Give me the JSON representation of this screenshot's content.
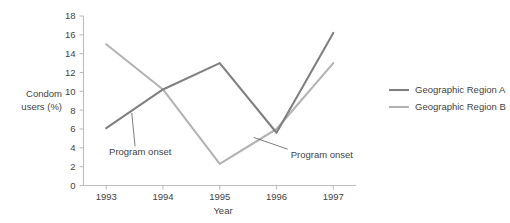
{
  "chart_data": {
    "type": "line",
    "title": "",
    "xlabel": "Year",
    "ylabel": "Condom users (%)",
    "categories": [
      "1993",
      "1994",
      "1995",
      "1996",
      "1997"
    ],
    "x": [
      1993,
      1994,
      1995,
      1996,
      1997
    ],
    "xlim": [
      1992.6,
      1997.4
    ],
    "ylim": [
      0,
      18
    ],
    "yticks": [
      "0",
      "2",
      "4",
      "6",
      "8",
      "10",
      "12",
      "14",
      "16",
      "18"
    ],
    "ytick_values": [
      0,
      2,
      4,
      6,
      8,
      10,
      12,
      14,
      16,
      18
    ],
    "grid": false,
    "legend_position": "right",
    "series": [
      {
        "name": "Geographic Region A",
        "color": "#808080",
        "values": [
          6.1,
          10.2,
          13.0,
          5.6,
          16.2
        ]
      },
      {
        "name": "Geographic Region B",
        "color": "#b3b3b3",
        "values": [
          15.0,
          10.2,
          2.3,
          6.0,
          13.0
        ]
      }
    ],
    "annotations": [
      {
        "text": "Program onset",
        "series": "Geographic Region A",
        "at_x": 1993.45,
        "at_y": 7.7,
        "label_x": 1993.05,
        "label_y": 3.2
      },
      {
        "text": "Program onset",
        "series": "Geographic Region B",
        "at_x": 1995.6,
        "at_y": 5.1,
        "label_x": 1996.25,
        "label_y": 2.9
      }
    ]
  },
  "legend": {
    "items": [
      {
        "label": "Geographic Region A",
        "color": "#808080"
      },
      {
        "label": "Geographic Region B",
        "color": "#b3b3b3"
      }
    ]
  }
}
